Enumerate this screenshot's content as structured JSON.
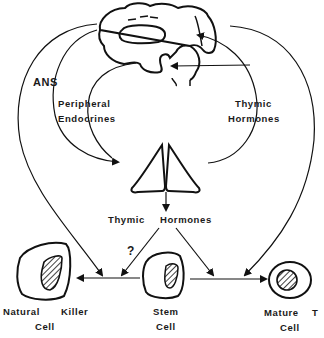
{
  "diagram": {
    "nodes": {
      "brain": {
        "label": ""
      },
      "thymus": {
        "label": ""
      },
      "nk_cell": {
        "line1": "Natural",
        "line1b": "Killer",
        "line2": "Cell"
      },
      "stem_cell": {
        "line1": "Stem",
        "line2": "Cell"
      },
      "mature_t_cell": {
        "line1": "Mature",
        "line1b": "T",
        "line2": "Cell"
      }
    },
    "labels": {
      "ans": "ANS",
      "peripheral_1": "Peripheral",
      "peripheral_2": "Endocrines",
      "thymic_right_1": "Thymic",
      "thymic_right_2": "Hormones",
      "thymic_center_1": "Thymic",
      "thymic_center_2": "Hormones",
      "question": "?"
    },
    "colors": {
      "stroke": "#111111",
      "background": "#ffffff"
    }
  }
}
